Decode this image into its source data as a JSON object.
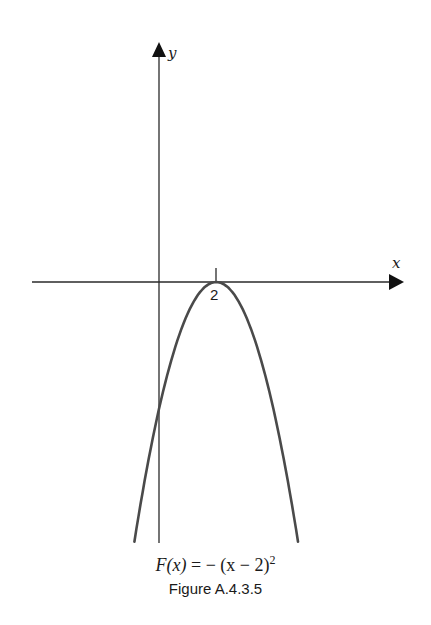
{
  "chart_data": {
    "type": "line",
    "title": "Figure A.4.3.5",
    "function_label": "F(x) = -(x - 2)^2",
    "xlabel": "x",
    "ylabel": "y",
    "x_ticks": [
      2
    ],
    "x_tick_labels": [
      "2"
    ],
    "vertex": [
      2,
      0
    ],
    "y_intercept": -4,
    "xlim": [
      -5.5,
      8.6
    ],
    "ylim": [
      -8.2,
      7.5
    ],
    "grid": false,
    "series": [
      {
        "name": "F(x) = -(x - 2)^2",
        "x": [
          -0.86,
          0,
          1,
          2,
          3,
          4,
          4.86
        ],
        "y": [
          -8.18,
          -4,
          -1,
          0,
          -1,
          -4,
          -8.18
        ]
      }
    ]
  },
  "labels": {
    "x_axis": "x",
    "y_axis": "y",
    "tick_2": "2",
    "formula_lhs": "F(x)",
    "formula_rhs": " = − (x − 2)",
    "formula_exp": "2",
    "caption": "Figure A.4.3.5"
  },
  "colors": {
    "axis": "#2a2a2a",
    "curve": "#4a4a4a",
    "text": "#1a1a1a"
  }
}
